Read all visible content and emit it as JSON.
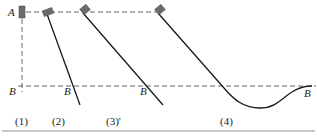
{
  "figure": {
    "point_labels": {
      "A": "A",
      "B_1": "B",
      "B_2": "B",
      "B_3": "B",
      "B_4": "B"
    },
    "captions": [
      "(1)",
      "(2)",
      "(3)'",
      "(4)"
    ],
    "colors": {
      "line": "#1a1a1a",
      "dashed": "#666666",
      "block": "#6b6b6b",
      "rule": "#c8c8c8"
    }
  }
}
